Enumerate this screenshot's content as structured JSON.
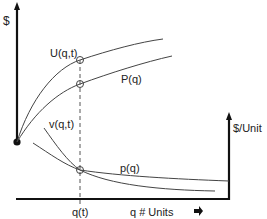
{
  "diagram": {
    "left_axis_label": "$",
    "right_axis_label": "$/Unit",
    "x_axis_label": "q  # Units",
    "x_marker_label": "q(t)",
    "curves": {
      "U": "U(q,t)",
      "P": "P(q)",
      "v": "v(q,t)",
      "p": "p(q)"
    },
    "colors": {
      "axis": "#111111",
      "curve": "#444444",
      "text": "#222222"
    }
  }
}
